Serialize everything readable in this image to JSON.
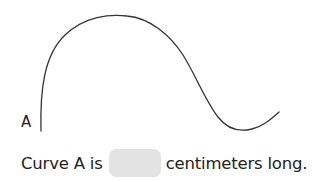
{
  "figure": {
    "curve_label": "A",
    "stroke_color": "#333333"
  },
  "question": {
    "prefix": "Curve A is",
    "answer_value": "",
    "suffix": "centimeters long.",
    "answer_box_color": "#e3e3e3"
  }
}
